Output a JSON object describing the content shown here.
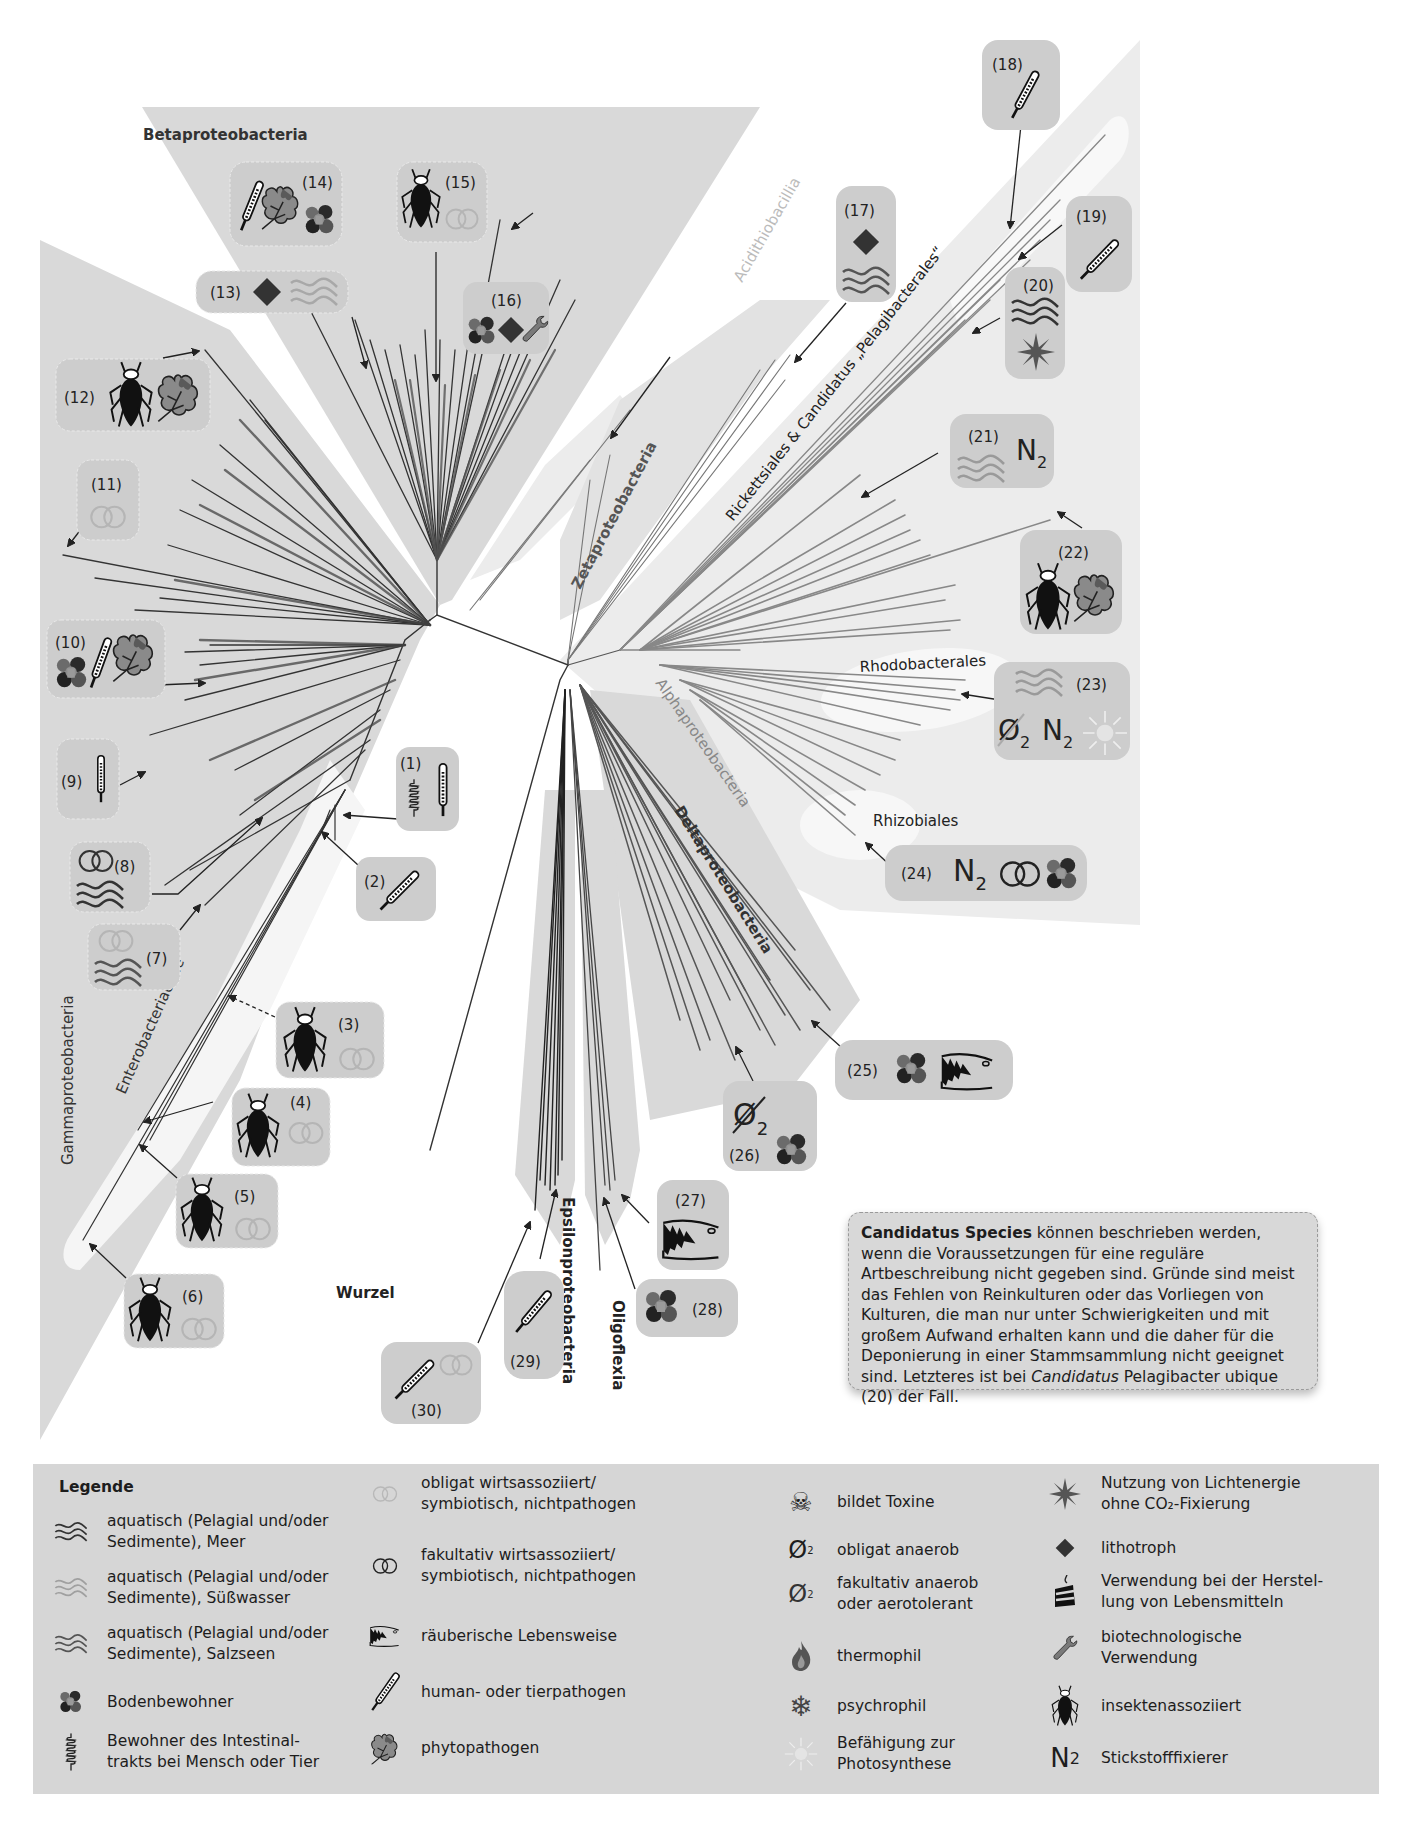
{
  "figure": {
    "root_label": "Wurzel",
    "clades": [
      {
        "id": "beta",
        "label": "Betaproteobacteria"
      },
      {
        "id": "gamma",
        "label": "Gammaproteobacteria"
      },
      {
        "id": "entero",
        "label": "Enterobacteriaceae"
      },
      {
        "id": "acidithio",
        "label": "Acidithiobacillia"
      },
      {
        "id": "zeta",
        "label": "Zetaproteobacteria"
      },
      {
        "id": "rickett",
        "label": "Rickettsiales & Candidatus „Pelagibacterales“"
      },
      {
        "id": "alpha",
        "label": "Alphaproteobacteria"
      },
      {
        "id": "rhodo",
        "label": "Rhodobacterales"
      },
      {
        "id": "rhizo",
        "label": "Rhizobiales"
      },
      {
        "id": "delta",
        "label": "Deltaproteobacteria"
      },
      {
        "id": "epsilon",
        "label": "Epsilonproteobacteria"
      },
      {
        "id": "oligo",
        "label": "Oligoflexia"
      }
    ],
    "callouts": [
      {
        "n": "(1)",
        "icons": [
          "intestine",
          "thermometer"
        ]
      },
      {
        "n": "(2)",
        "icons": [
          "thermometer"
        ]
      },
      {
        "n": "(3)",
        "icons": [
          "insect",
          "rings-obligate"
        ]
      },
      {
        "n": "(4)",
        "icons": [
          "insect",
          "rings-obligate"
        ]
      },
      {
        "n": "(5)",
        "icons": [
          "insect",
          "rings-obligate"
        ]
      },
      {
        "n": "(6)",
        "icons": [
          "insect",
          "rings-obligate"
        ]
      },
      {
        "n": "(7)",
        "icons": [
          "rings-obligate",
          "waves-salt"
        ]
      },
      {
        "n": "(8)",
        "icons": [
          "rings-facultative",
          "waves-sea"
        ]
      },
      {
        "n": "(9)",
        "icons": [
          "thermometer"
        ]
      },
      {
        "n": "(10)",
        "icons": [
          "soil",
          "thermometer",
          "leaf"
        ]
      },
      {
        "n": "(11)",
        "icons": [
          "rings-obligate"
        ]
      },
      {
        "n": "(12)",
        "icons": [
          "insect",
          "leaf"
        ]
      },
      {
        "n": "(13)",
        "icons": [
          "diamond",
          "waves-fresh"
        ]
      },
      {
        "n": "(14)",
        "icons": [
          "thermometer",
          "leaf",
          "soil"
        ]
      },
      {
        "n": "(15)",
        "icons": [
          "insect",
          "rings-obligate"
        ]
      },
      {
        "n": "(16)",
        "icons": [
          "soil",
          "diamond",
          "wrench"
        ]
      },
      {
        "n": "(17)",
        "icons": [
          "diamond",
          "waves-sea"
        ]
      },
      {
        "n": "(18)",
        "icons": [
          "thermometer"
        ]
      },
      {
        "n": "(19)",
        "icons": [
          "thermometer"
        ]
      },
      {
        "n": "(20)",
        "icons": [
          "waves-sea",
          "star"
        ]
      },
      {
        "n": "(21)",
        "icons": [
          "waves-fresh",
          "n2"
        ]
      },
      {
        "n": "(22)",
        "icons": [
          "insect",
          "leaf"
        ]
      },
      {
        "n": "(23)",
        "icons": [
          "waves-fresh",
          "o2-facultative",
          "n2",
          "sun"
        ]
      },
      {
        "n": "(24)",
        "icons": [
          "n2",
          "rings-facultative",
          "soil"
        ]
      },
      {
        "n": "(25)",
        "icons": [
          "soil",
          "predator"
        ]
      },
      {
        "n": "(26)",
        "icons": [
          "o2-obligate",
          "soil"
        ]
      },
      {
        "n": "(27)",
        "icons": [
          "predator"
        ]
      },
      {
        "n": "(28)",
        "icons": [
          "soil"
        ]
      },
      {
        "n": "(29)",
        "icons": [
          "thermometer"
        ]
      },
      {
        "n": "(30)",
        "icons": [
          "thermometer",
          "rings-obligate"
        ]
      }
    ],
    "n2_text": "N",
    "n2_sub": "2",
    "o2_text": "Ø",
    "o2_sub": "2"
  },
  "info_box": {
    "bold": "Candidatus Species",
    "text1": " können beschrieben werden, wenn die Voraussetzungen für eine reguläre Artbeschreibung nicht gegeben sind. Gründe sind meist das Fehlen von Reinkulturen oder das Vorliegen von Kulturen, die man nur unter Schwierigkeiten und mit großem Aufwand erhalten kann und die daher für die Deponierung in einer Stammsammlung nicht geeignet sind. Letzteres ist bei ",
    "italic": "Candidatus",
    "text2": " Pelagibacter ubique (20) der Fall."
  },
  "legend": {
    "title": "Legende",
    "items": [
      {
        "icon": "waves-sea",
        "text": "aquatisch (Pelagial und/oder\nSedimente), Meer"
      },
      {
        "icon": "waves-fresh",
        "text": "aquatisch (Pelagial und/oder\nSedimente), Süßwasser"
      },
      {
        "icon": "waves-salt",
        "text": "aquatisch (Pelagial und/oder\nSedimente), Salzseen"
      },
      {
        "icon": "soil",
        "text": "Bodenbewohner"
      },
      {
        "icon": "intestine",
        "text": "Bewohner des Intestinal-\ntrakts bei Mensch oder Tier"
      },
      {
        "icon": "rings-obligate",
        "text": "obligat wirtsassoziiert/\nsymbiotisch, nichtpathogen"
      },
      {
        "icon": "rings-facultative",
        "text": "fakultativ wirtsassoziiert/\nsymbiotisch, nichtpathogen"
      },
      {
        "icon": "predator",
        "text": "räuberische Lebensweise"
      },
      {
        "icon": "thermometer",
        "text": "human- oder tierpathogen"
      },
      {
        "icon": "leaf",
        "text": "phytopathogen"
      },
      {
        "icon": "skull",
        "text": "bildet Toxine"
      },
      {
        "icon": "o2-obligate",
        "text": "obligat anaerob"
      },
      {
        "icon": "o2-facultative",
        "text": "fakultativ anaerob\noder aerotolerant"
      },
      {
        "icon": "flame",
        "text": "thermophil"
      },
      {
        "icon": "snowflake",
        "text": "psychrophil"
      },
      {
        "icon": "sun",
        "text": "Befähigung zur\nPhotosynthese"
      },
      {
        "icon": "star",
        "text": "Nutzung von Lichtenergie\nohne CO₂-Fixierung"
      },
      {
        "icon": "diamond",
        "text": "lithotroph"
      },
      {
        "icon": "cake",
        "text": "Verwendung bei der Herstel-\nlung von Lebensmitteln"
      },
      {
        "icon": "wrench",
        "text": "biotechnologische\nVerwendung"
      },
      {
        "icon": "insect",
        "text": "insektenassoziiert"
      },
      {
        "icon": "n2",
        "text": "Stickstofffixierer"
      }
    ]
  },
  "colors": {
    "clade_fill": "#d9d9d9",
    "clade_fill_light": "#ececec",
    "highlight": "#f7f7f7",
    "box_fill": "#cdcdcd",
    "branch_dark": "#333333",
    "branch_mid": "#777777",
    "legend_bg": "#d6d6d6"
  }
}
